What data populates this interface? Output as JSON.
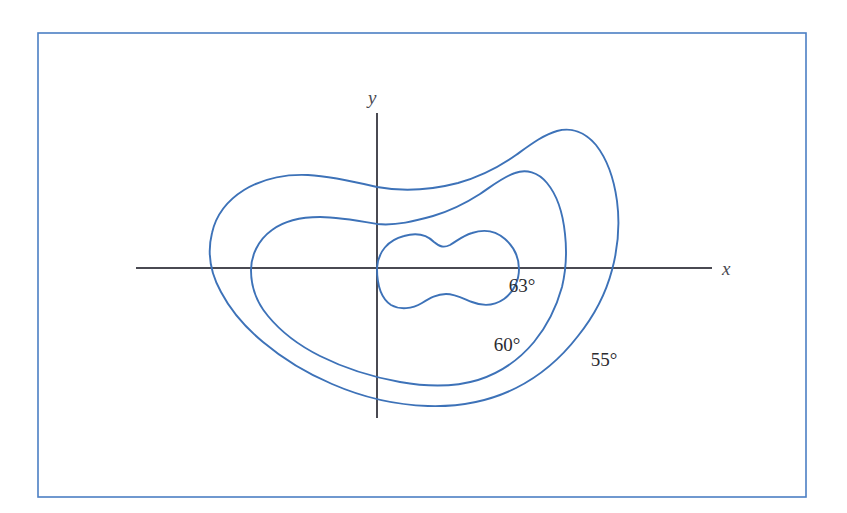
{
  "figure": {
    "kind": "contour-map",
    "background_color": "#ffffff",
    "border": {
      "name": "figure-border",
      "color": "#4b7fc4",
      "width": 1.6,
      "x": 38,
      "y": 33,
      "w": 768,
      "h": 464
    },
    "axes": {
      "color": "#4a4a52",
      "width": 2.0,
      "origin": {
        "x": 377,
        "y": 268
      },
      "x_axis": {
        "x1": 136,
        "y1": 268,
        "x2": 712,
        "y2": 268
      },
      "y_axis": {
        "x1": 377,
        "y1": 113,
        "x2": 377,
        "y2": 418
      },
      "x_label": "x",
      "y_label": "y",
      "x_label_pos": {
        "x": 722,
        "y": 275
      },
      "y_label_pos": {
        "x": 368,
        "y": 104
      }
    },
    "contour_color": "#3d72b8",
    "contour_width": 1.9
  },
  "chart_data": {
    "type": "contour",
    "title": "",
    "xlabel": "x",
    "ylabel": "y",
    "unit": "degrees",
    "legend_position": "inline-labels",
    "grid": false,
    "levels": [
      {
        "label": "63°",
        "value": 63,
        "rank": "innermost",
        "label_pos": {
          "x": 522,
          "y": 292
        },
        "path": "M 377,268 C 378,252 388,240 404,236 C 418,232 428,236 434,242 C 440,247 444,248 450,245 C 457,241 462,236 472,233 C 484,229 496,231 505,239 C 514,247 519,258 519,269 C 519,280 514,292 504,299 C 494,306 482,306 472,302 C 462,298 455,294 446,294 C 437,294 430,298 422,303 C 412,309 400,310 391,305 C 382,299 377,286 377,268 Z"
      },
      {
        "label": "60°",
        "value": 60,
        "rank": "middle",
        "label_pos": {
          "x": 507,
          "y": 351
        },
        "path": "M 377,224 C 360,221 338,217 320,217 C 300,217 284,221 272,230 C 258,240 251,256 251,270 C 251,287 257,303 268,316 C 282,333 300,346 320,356 C 344,368 372,377 400,382 C 428,387 455,387 478,380 C 500,373 519,360 534,342 C 548,325 557,305 562,287 C 566,270 567,252 565,234 C 563,214 557,195 547,183 C 538,172 526,169 515,173 C 503,177 492,186 480,194 C 466,203 450,211 433,216 C 415,221 396,226 377,224 Z"
      },
      {
        "label": "55°",
        "value": 55,
        "rank": "outermost",
        "label_pos": {
          "x": 604,
          "y": 366
        },
        "path": "M 377,187 C 356,182 330,176 308,175 C 284,174 262,179 244,190 C 228,200 216,215 212,233 C 207,253 211,274 221,292 C 231,311 246,328 263,342 C 282,358 306,373 332,384 C 362,397 396,405 428,406 C 459,407 490,401 516,388 C 540,376 561,358 578,336 C 594,316 606,293 612,270 C 618,248 620,224 617,201 C 614,179 607,159 596,145 C 585,132 571,127 557,131 C 543,135 530,145 516,155 C 499,167 479,177 458,183 C 431,190 404,192 377,187 Z"
      }
    ]
  }
}
